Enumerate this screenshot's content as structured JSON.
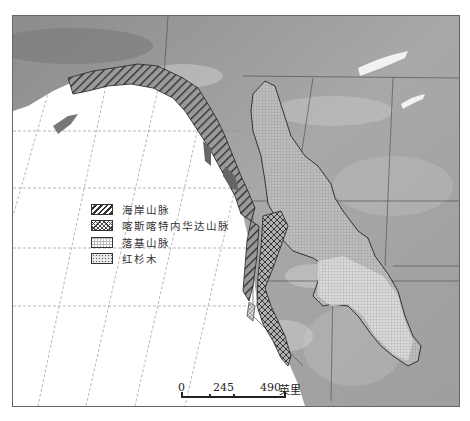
{
  "map": {
    "title": "",
    "type": "physical relief map of western North America",
    "colors": {
      "ocean": "#ffffff",
      "land_light": "#b5b5b5",
      "land_dark": "#808080",
      "border": "#555555"
    }
  },
  "legend": {
    "items": [
      {
        "label": "海岸山脉",
        "pattern": "diagonal-hatch"
      },
      {
        "label": "喀斯喀特内华达山脉",
        "pattern": "cross-hatch"
      },
      {
        "label": "落基山脉",
        "pattern": "grid"
      },
      {
        "label": "红杉木",
        "pattern": "stipple"
      }
    ]
  },
  "scale_bar": {
    "ticks": [
      "0",
      "245",
      "490"
    ],
    "unit": "英里"
  }
}
